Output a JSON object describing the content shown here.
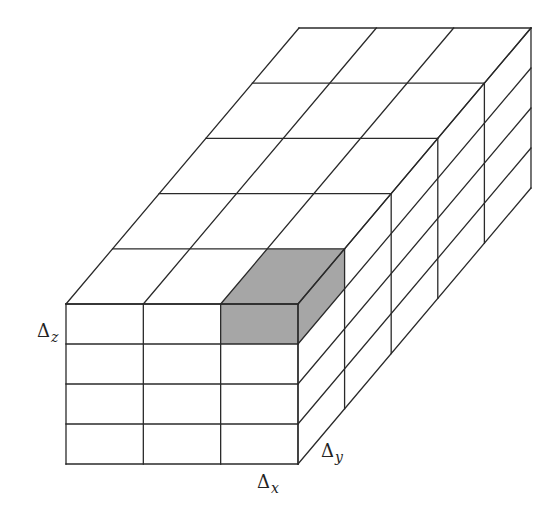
{
  "diagram": {
    "grid": {
      "cells_x": 3,
      "cells_depth": 5,
      "cells_z": 4,
      "front_origin": [
        66,
        304
      ],
      "cell_width": 77.33,
      "cell_height": 40,
      "depth_step": [
        46.6,
        -55.2
      ]
    },
    "highlighted_cell": {
      "x_index": 2,
      "depth_index": 0,
      "z_index": 0
    },
    "colors": {
      "line": "#2a2a2a",
      "fill": "#ffffff",
      "highlight": "#a6a6a6"
    },
    "labels": {
      "dz": {
        "symbol": "Δ",
        "subscript": "z",
        "x": 37,
        "y": 322
      },
      "dy": {
        "symbol": "Δ",
        "subscript": "y",
        "x": 321,
        "y": 442
      },
      "dx": {
        "symbol": "Δ",
        "subscript": "x",
        "x": 257,
        "y": 473
      }
    }
  }
}
